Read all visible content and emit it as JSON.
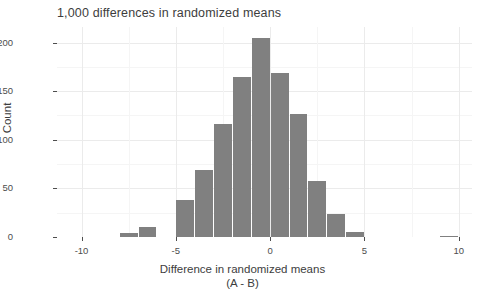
{
  "chart_data": {
    "type": "bar",
    "title": "1,000 differences in randomized means",
    "xlabel_line1": "Difference in randomized means",
    "xlabel_line2": "(A - B)",
    "ylabel": "Count",
    "bin_width": 1,
    "categories": [
      -8,
      -7,
      -6,
      -5,
      -4,
      -3,
      -2,
      -1,
      0,
      1,
      2,
      3,
      4,
      5,
      6,
      9
    ],
    "bin_starts": [
      -8,
      -7,
      -6,
      -5,
      -4,
      -3,
      -2,
      -1,
      0,
      1,
      2,
      3,
      4,
      5,
      6,
      9
    ],
    "values": [
      4,
      10,
      0,
      38,
      69,
      116,
      165,
      205,
      169,
      127,
      58,
      24,
      0,
      5,
      0,
      1
    ],
    "bars": [
      {
        "bin_start": -8,
        "bin_end": -7,
        "count": 4
      },
      {
        "bin_start": -7,
        "bin_end": -6,
        "count": 10
      },
      {
        "bin_start": -5,
        "bin_end": -4,
        "count": 38
      },
      {
        "bin_start": -4,
        "bin_end": -3,
        "count": 69
      },
      {
        "bin_start": -3,
        "bin_end": -2,
        "count": 116
      },
      {
        "bin_start": -2,
        "bin_end": -1,
        "count": 165
      },
      {
        "bin_start": -1,
        "bin_end": 0,
        "count": 205
      },
      {
        "bin_start": 0,
        "bin_end": 1,
        "count": 169
      },
      {
        "bin_start": 1,
        "bin_end": 2,
        "count": 127
      },
      {
        "bin_start": 2,
        "bin_end": 3,
        "count": 58
      },
      {
        "bin_start": 3,
        "bin_end": 4,
        "count": 24
      },
      {
        "bin_start": 4,
        "bin_end": 5,
        "count": 5
      },
      {
        "bin_start": 9,
        "bin_end": 10,
        "count": 1
      }
    ],
    "xticks": [
      -10,
      -5,
      0,
      5,
      10
    ],
    "xtick_labels": [
      "-10",
      "-5",
      "0",
      "5",
      "10"
    ],
    "yticks": [
      0,
      50,
      100,
      150,
      200
    ],
    "ytick_labels": [
      "0",
      "50",
      "100",
      "150",
      "200"
    ],
    "xlim": [
      -11.3,
      10.7
    ],
    "ylim": [
      0,
      216
    ],
    "grid": true,
    "legend": "none",
    "colors": {
      "bar_fill": "#808080",
      "panel_background": "#ffffff",
      "gridline_major": "#ebebeb",
      "gridline_minor": "#f5f5f5",
      "text": "#4d4d4d",
      "title_text": "#3d3d3d"
    }
  }
}
